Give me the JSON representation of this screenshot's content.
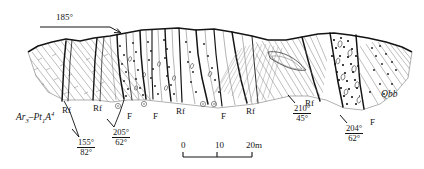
{
  "figure": {
    "type": "geological-cross-section",
    "background_color": "#ffffff",
    "line_color": "#141414"
  },
  "orientation": {
    "bearing_label": "185°",
    "arrow_direction": "right-down"
  },
  "units": [
    {
      "id": "basement",
      "label_html": "Ar<sub>3</sub>–Pt<sub>1</sub><i>A</i><sup>4</sup>",
      "label_text": "Ar3-Pt1A4",
      "x": 16,
      "y": 113
    },
    {
      "id": "conglomerate",
      "label_html": "Q<i>bb</i>",
      "label_text": "Qbb",
      "x": 381,
      "y": 90
    }
  ],
  "fault_labels": [
    {
      "text": "Rf",
      "x": 62,
      "y": 106
    },
    {
      "text": "Rf",
      "x": 93,
      "y": 104
    },
    {
      "text": "F",
      "x": 127,
      "y": 112
    },
    {
      "text": "F",
      "x": 153,
      "y": 112
    },
    {
      "text": "Rf",
      "x": 176,
      "y": 107
    },
    {
      "text": "F",
      "x": 221,
      "y": 112
    },
    {
      "text": "Rf",
      "x": 246,
      "y": 107
    },
    {
      "text": "Rf",
      "x": 305,
      "y": 99
    },
    {
      "text": "F",
      "x": 370,
      "y": 118
    }
  ],
  "dip_symbols": [
    {
      "id": "dip-1",
      "strike": "155°",
      "dip": "82°",
      "x": 77,
      "y": 138,
      "tick_x": 74,
      "tick_y": 128,
      "tick_angle": -62
    },
    {
      "id": "dip-2",
      "strike": "205°",
      "dip": "62°",
      "x": 112,
      "y": 128,
      "tick_x": 109,
      "tick_y": 118,
      "tick_angle": -62
    },
    {
      "id": "dip-3",
      "strike": "210°",
      "dip": "45°",
      "x": 293,
      "y": 104,
      "tick_x": 290,
      "tick_y": 94,
      "tick_angle": -62
    },
    {
      "id": "dip-4",
      "strike": "204°",
      "dip": "62°",
      "x": 345,
      "y": 124,
      "tick_x": 342,
      "tick_y": 114,
      "tick_angle": -62
    }
  ],
  "scale_bar": {
    "ticks": [
      {
        "label": "0",
        "x": 181
      },
      {
        "label": "10",
        "x": 215
      },
      {
        "label": "20m",
        "x": 246
      }
    ],
    "bar_left": 183,
    "bar_right": 252,
    "bar_y": 157,
    "label_y": 140
  }
}
